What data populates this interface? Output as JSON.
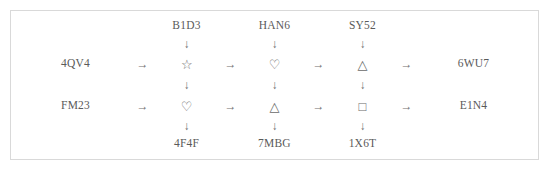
{
  "figure": {
    "border_color": "#d9d9d9",
    "text_color": "#5a5a5a",
    "glyph_color": "#6a6a6a",
    "background": "#ffffff",
    "arrow_right": "→",
    "arrow_down": "↓"
  },
  "diagram": {
    "type": "flow-grid",
    "top_labels": [
      "B1D3",
      "HAN6",
      "SY52"
    ],
    "bottom_labels": [
      "4F4F",
      "7MBG",
      "1X6T"
    ],
    "left_labels": [
      "4QV4",
      "FM23"
    ],
    "right_labels": [
      "6WU7",
      "E1N4"
    ],
    "rows": [
      {
        "entry": "4QV4",
        "exit": "6WU7",
        "shapes": [
          "☆",
          "♡",
          "△"
        ],
        "shape_names": [
          "star-outline",
          "heart-outline",
          "triangle-outline"
        ]
      },
      {
        "entry": "FM23",
        "exit": "E1N4",
        "shapes": [
          "♡",
          "△",
          "□"
        ],
        "shape_names": [
          "heart-outline",
          "triangle-outline",
          "square-outline"
        ]
      }
    ]
  }
}
